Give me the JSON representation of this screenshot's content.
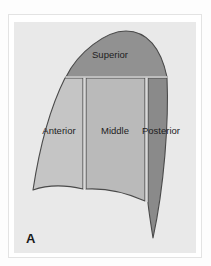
{
  "figure": {
    "panel_letter": "A",
    "caption_label": "A",
    "background_color": "#e9e9e9",
    "outline_color": "#4a4a4a",
    "divider_color": "#d8d8d8",
    "label_color": "#1d1d1d",
    "frame_color": "#e3e3e3",
    "page_color": "#ffffff"
  },
  "diagram": {
    "title": "A",
    "view": "lateral lung segments",
    "segments": [
      {
        "id": "superior",
        "label": "Superior",
        "fill": "#919191",
        "label_x": 96,
        "label_y": 33
      },
      {
        "id": "anterior",
        "label": "Anterior",
        "fill": "#c5c5c5",
        "label_x": 47,
        "label_y": 108
      },
      {
        "id": "middle",
        "label": "Middle",
        "fill": "#bababa",
        "label_x": 102,
        "label_y": 108
      },
      {
        "id": "posterior",
        "label": "Posterior",
        "fill": "#8a8a8a",
        "label_x": 148,
        "label_y": 108
      }
    ]
  }
}
